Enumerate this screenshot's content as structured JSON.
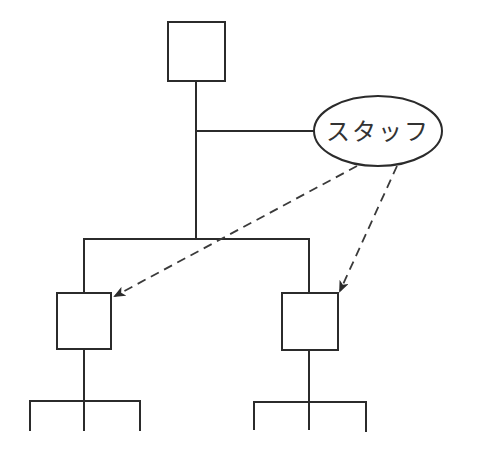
{
  "diagram": {
    "type": "organization-chart",
    "nodes": [
      {
        "id": "top",
        "label": "",
        "shape": "box"
      },
      {
        "id": "staff",
        "label": "スタッフ",
        "shape": "ellipse"
      },
      {
        "id": "left-sub",
        "label": "",
        "shape": "box"
      },
      {
        "id": "right-sub",
        "label": "",
        "shape": "box"
      }
    ],
    "edges": [
      {
        "from": "top",
        "to": "staff",
        "style": "solid"
      },
      {
        "from": "top",
        "to": "left-sub",
        "style": "solid"
      },
      {
        "from": "top",
        "to": "right-sub",
        "style": "solid"
      },
      {
        "from": "staff",
        "to": "left-sub",
        "style": "dashed-arrow"
      },
      {
        "from": "staff",
        "to": "right-sub",
        "style": "dashed-arrow"
      }
    ],
    "staff_label": "スタッフ",
    "colors": {
      "line": "#2b2b2b",
      "background": "#ffffff"
    }
  }
}
